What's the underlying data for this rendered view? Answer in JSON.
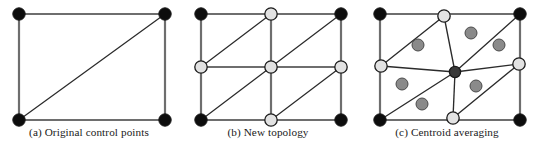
{
  "figure": {
    "type": "diagram",
    "background_color": "#ffffff",
    "panel_count": 3
  },
  "style": {
    "edge_color": "#2b2b2b",
    "frame_color": "#6e6e6e",
    "node_black": "#0d0d0d",
    "node_light": "#e2e2e2",
    "node_dark_gray": "#3a3a3a",
    "centroid_gray": "#8a8a8a",
    "node_stroke": "#1a1a1a",
    "caption_color": "#1a1a1a"
  },
  "panels": [
    {
      "id": "a",
      "caption": "(a) Original control points",
      "frame": {
        "x": 19,
        "y": 14,
        "w": 146,
        "h": 106
      },
      "nodes": [
        {
          "name": "corner-top-left",
          "x": 19,
          "y": 14,
          "r": 6.2,
          "kind": "black"
        },
        {
          "name": "corner-top-right",
          "x": 165,
          "y": 14,
          "r": 6.2,
          "kind": "black"
        },
        {
          "name": "corner-bottom-left",
          "x": 19,
          "y": 120,
          "r": 6.2,
          "kind": "black"
        },
        {
          "name": "corner-bottom-right",
          "x": 165,
          "y": 120,
          "r": 6.2,
          "kind": "black"
        }
      ],
      "frame_edges": [
        {
          "name": "edge-top",
          "x1": 19,
          "y1": 14,
          "x2": 165,
          "y2": 14
        },
        {
          "name": "edge-right",
          "x1": 165,
          "y1": 14,
          "x2": 165,
          "y2": 120
        },
        {
          "name": "edge-bottom",
          "x1": 19,
          "y1": 120,
          "x2": 165,
          "y2": 120
        },
        {
          "name": "edge-left",
          "x1": 19,
          "y1": 14,
          "x2": 19,
          "y2": 120
        }
      ],
      "diagonals": [
        {
          "name": "diagonal-main",
          "x1": 19,
          "y1": 120,
          "x2": 165,
          "y2": 14
        }
      ],
      "centroids": []
    },
    {
      "id": "b",
      "caption": "(b) New topology",
      "frame": {
        "x": 22,
        "y": 14,
        "w": 140,
        "h": 106
      },
      "nodes": [
        {
          "name": "corner-top-left",
          "x": 22,
          "y": 14,
          "r": 6.2,
          "kind": "black"
        },
        {
          "name": "corner-top-right",
          "x": 162,
          "y": 14,
          "r": 6.2,
          "kind": "black"
        },
        {
          "name": "corner-bottom-left",
          "x": 22,
          "y": 120,
          "r": 6.2,
          "kind": "black"
        },
        {
          "name": "corner-bottom-right",
          "x": 162,
          "y": 120,
          "r": 6.2,
          "kind": "black"
        },
        {
          "name": "edge-midpoint-top",
          "x": 92,
          "y": 14,
          "r": 6.2,
          "kind": "light"
        },
        {
          "name": "edge-midpoint-bottom",
          "x": 92,
          "y": 120,
          "r": 6.2,
          "kind": "light"
        },
        {
          "name": "edge-midpoint-left",
          "x": 22,
          "y": 67,
          "r": 6.2,
          "kind": "light"
        },
        {
          "name": "edge-midpoint-right",
          "x": 162,
          "y": 67,
          "r": 6.2,
          "kind": "light"
        },
        {
          "name": "face-center",
          "x": 92,
          "y": 67,
          "r": 6.2,
          "kind": "light"
        }
      ],
      "frame_edges": [
        {
          "name": "edge-top",
          "x1": 22,
          "y1": 14,
          "x2": 162,
          "y2": 14
        },
        {
          "name": "edge-right",
          "x1": 162,
          "y1": 14,
          "x2": 162,
          "y2": 120
        },
        {
          "name": "edge-bottom",
          "x1": 22,
          "y1": 120,
          "x2": 162,
          "y2": 120
        },
        {
          "name": "edge-left",
          "x1": 22,
          "y1": 14,
          "x2": 22,
          "y2": 120
        },
        {
          "name": "split-horizontal",
          "x1": 22,
          "y1": 67,
          "x2": 162,
          "y2": 67
        },
        {
          "name": "split-vertical",
          "x1": 92,
          "y1": 14,
          "x2": 92,
          "y2": 120
        }
      ],
      "diagonals": [
        {
          "name": "diagonal-quadrant-top-left",
          "x1": 22,
          "y1": 67,
          "x2": 92,
          "y2": 14
        },
        {
          "name": "diagonal-quadrant-top-right",
          "x1": 92,
          "y1": 67,
          "x2": 162,
          "y2": 14
        },
        {
          "name": "diagonal-quadrant-bottom-left",
          "x1": 22,
          "y1": 120,
          "x2": 92,
          "y2": 67
        },
        {
          "name": "diagonal-quadrant-bottom-right",
          "x1": 92,
          "y1": 120,
          "x2": 162,
          "y2": 67
        }
      ],
      "centroids": []
    },
    {
      "id": "c",
      "caption": "(c) Centroid averaging",
      "frame": {
        "x": 22,
        "y": 14,
        "w": 140,
        "h": 106
      },
      "nodes": [
        {
          "name": "corner-top-left",
          "x": 22,
          "y": 14,
          "r": 6.2,
          "kind": "black"
        },
        {
          "name": "corner-top-right",
          "x": 162,
          "y": 14,
          "r": 6.2,
          "kind": "black"
        },
        {
          "name": "corner-bottom-left",
          "x": 22,
          "y": 120,
          "r": 6.2,
          "kind": "black"
        },
        {
          "name": "corner-bottom-right",
          "x": 162,
          "y": 120,
          "r": 6.2,
          "kind": "black"
        },
        {
          "name": "edge-midpoint-top",
          "x": 86,
          "y": 16,
          "r": 6.2,
          "kind": "light"
        },
        {
          "name": "edge-midpoint-bottom",
          "x": 95,
          "y": 118,
          "r": 6.2,
          "kind": "light"
        },
        {
          "name": "edge-midpoint-left",
          "x": 23,
          "y": 66,
          "r": 6.2,
          "kind": "light"
        },
        {
          "name": "edge-midpoint-right",
          "x": 161,
          "y": 64,
          "r": 6.2,
          "kind": "light"
        },
        {
          "name": "face-center-averaged",
          "x": 97,
          "y": 72,
          "r": 5.6,
          "kind": "dark"
        }
      ],
      "frame_edges": [
        {
          "name": "edge-top",
          "x1": 22,
          "y1": 14,
          "x2": 162,
          "y2": 14
        },
        {
          "name": "edge-right",
          "x1": 162,
          "y1": 14,
          "x2": 162,
          "y2": 120
        },
        {
          "name": "edge-bottom",
          "x1": 22,
          "y1": 120,
          "x2": 162,
          "y2": 120
        },
        {
          "name": "edge-left",
          "x1": 22,
          "y1": 14,
          "x2": 22,
          "y2": 120
        }
      ],
      "mesh_edges": [
        {
          "name": "mesh-left-to-center",
          "x1": 23,
          "y1": 66,
          "x2": 97,
          "y2": 72
        },
        {
          "name": "mesh-center-to-right",
          "x1": 97,
          "y1": 72,
          "x2": 161,
          "y2": 64
        },
        {
          "name": "mesh-top-to-center",
          "x1": 86,
          "y1": 16,
          "x2": 97,
          "y2": 72
        },
        {
          "name": "mesh-center-to-bottom",
          "x1": 97,
          "y1": 72,
          "x2": 95,
          "y2": 118
        },
        {
          "name": "mesh-left-to-top",
          "x1": 23,
          "y1": 66,
          "x2": 86,
          "y2": 16
        },
        {
          "name": "mesh-center-to-topright",
          "x1": 97,
          "y1": 72,
          "x2": 162,
          "y2": 14
        },
        {
          "name": "mesh-bottomleft-to-center",
          "x1": 22,
          "y1": 120,
          "x2": 97,
          "y2": 72
        },
        {
          "name": "mesh-bottom-to-right",
          "x1": 95,
          "y1": 118,
          "x2": 161,
          "y2": 64
        }
      ],
      "centroids": [
        {
          "name": "centroid-marker-1",
          "x": 60,
          "y": 45,
          "r": 6.0
        },
        {
          "name": "centroid-marker-2",
          "x": 113,
          "y": 33,
          "r": 6.0
        },
        {
          "name": "centroid-marker-3",
          "x": 141,
          "y": 45,
          "r": 6.0
        },
        {
          "name": "centroid-marker-4",
          "x": 44,
          "y": 84,
          "r": 6.0
        },
        {
          "name": "centroid-marker-5",
          "x": 118,
          "y": 86,
          "r": 6.0
        },
        {
          "name": "centroid-marker-6",
          "x": 64,
          "y": 104,
          "r": 6.0
        }
      ]
    }
  ]
}
